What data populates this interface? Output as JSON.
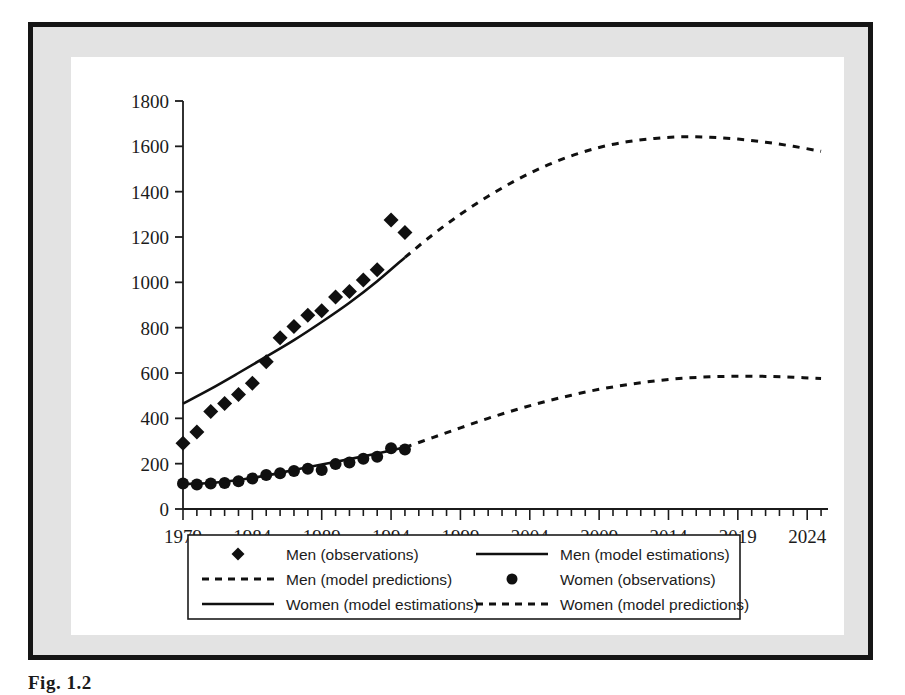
{
  "figure": {
    "caption": "Fig. 1.2",
    "frame_color": "#151515",
    "mat_color": "#e3e3e3",
    "plot_background": "#ffffff"
  },
  "chart_data": {
    "type": "line",
    "title": "",
    "xlabel": "",
    "ylabel": "",
    "xlim": [
      1979,
      2025.5
    ],
    "ylim": [
      0,
      1800
    ],
    "grid": false,
    "legend_position": "bottom",
    "x_ticks": [
      1979,
      1984,
      1989,
      1994,
      1999,
      2004,
      2009,
      2014,
      2019,
      2024
    ],
    "x_tick_labels": [
      "1979",
      "1984",
      "1989",
      "1994",
      "1999",
      "2004",
      "2009",
      "2014",
      "2019",
      "2024"
    ],
    "x_minor_tick_interval": 1,
    "y_ticks": [
      0,
      200,
      400,
      600,
      800,
      1000,
      1200,
      1400,
      1600,
      1800
    ],
    "y_tick_labels": [
      "0",
      "200",
      "400",
      "600",
      "800",
      "1000",
      "1200",
      "1400",
      "1600",
      "1800"
    ],
    "series": [
      {
        "name": "Men (observations)",
        "style": "markers",
        "marker": "diamond",
        "color": "#101010",
        "x": [
          1979,
          1980,
          1981,
          1982,
          1983,
          1984,
          1985,
          1986,
          1987,
          1988,
          1989,
          1990,
          1991,
          1992,
          1993,
          1994,
          1995
        ],
        "values": [
          290,
          340,
          430,
          465,
          505,
          555,
          650,
          755,
          805,
          855,
          875,
          935,
          960,
          1010,
          1055,
          1275,
          1220
        ]
      },
      {
        "name": "Men (model estimations)",
        "style": "solid-line",
        "color": "#101010",
        "x": [
          1979,
          1981,
          1983,
          1985,
          1987,
          1989,
          1991,
          1993,
          1995
        ],
        "values": [
          465,
          530,
          600,
          672,
          745,
          825,
          910,
          1005,
          1110
        ]
      },
      {
        "name": "Men (model predictions)",
        "style": "dashed-line",
        "color": "#101010",
        "x": [
          1995,
          1997,
          1999,
          2001,
          2003,
          2005,
          2007,
          2009,
          2011,
          2013,
          2015,
          2017,
          2019,
          2021,
          2023,
          2025
        ],
        "values": [
          1110,
          1210,
          1300,
          1380,
          1450,
          1510,
          1558,
          1595,
          1620,
          1635,
          1642,
          1640,
          1632,
          1618,
          1600,
          1578
        ]
      },
      {
        "name": "Women (observations)",
        "style": "markers",
        "marker": "circle",
        "color": "#101010",
        "x": [
          1979,
          1980,
          1981,
          1982,
          1983,
          1984,
          1985,
          1986,
          1987,
          1988,
          1989,
          1990,
          1991,
          1992,
          1993,
          1994,
          1995
        ],
        "values": [
          112,
          108,
          112,
          115,
          122,
          135,
          150,
          158,
          168,
          178,
          172,
          198,
          205,
          222,
          230,
          268,
          262
        ]
      },
      {
        "name": "Women (model estimations)",
        "style": "solid-line",
        "color": "#101010",
        "x": [
          1979,
          1981,
          1983,
          1985,
          1987,
          1989,
          1991,
          1993,
          1995
        ],
        "values": [
          110,
          115,
          128,
          148,
          172,
          196,
          220,
          245,
          272
        ]
      },
      {
        "name": "Women (model predictions)",
        "style": "dashed-line",
        "color": "#101010",
        "x": [
          1995,
          1997,
          1999,
          2001,
          2003,
          2005,
          2007,
          2009,
          2011,
          2013,
          2015,
          2017,
          2019,
          2021,
          2023,
          2025
        ],
        "values": [
          272,
          315,
          358,
          400,
          438,
          472,
          502,
          528,
          548,
          565,
          577,
          583,
          586,
          585,
          581,
          576
        ]
      }
    ]
  },
  "legend": {
    "entries": [
      {
        "label": "Men (observations)",
        "style": "diamond-marker"
      },
      {
        "label": "Men (model estimations)",
        "style": "solid-line"
      },
      {
        "label": "Men (model predictions)",
        "style": "dashed-line"
      },
      {
        "label": "Women (observations)",
        "style": "circle-marker"
      },
      {
        "label": "Women (model estimations)",
        "style": "solid-line"
      },
      {
        "label": "Women (model predictions)",
        "style": "dashed-line"
      }
    ]
  }
}
